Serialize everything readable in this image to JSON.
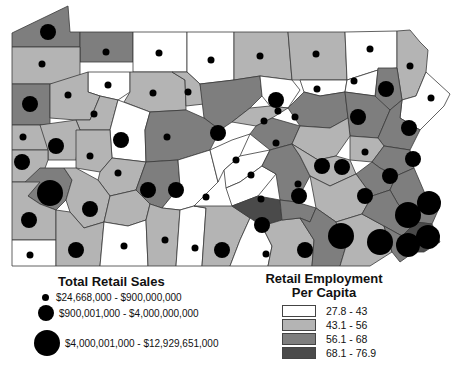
{
  "colors": {
    "class1": "#ffffff",
    "class2": "#b4b4b4",
    "class3": "#7e7e7e",
    "class4": "#4a4a4a",
    "symbol": "#000000",
    "border": "#3a3a3a"
  },
  "legend_sales": {
    "title": "Total Retail Sales",
    "items": [
      {
        "label": "$24,668,000 - $900,000,000",
        "size": "small"
      },
      {
        "label": "$900,001,000 - $4,000,000,000",
        "size": "medium"
      },
      {
        "label": "$4,000,001,000 - $12,929,651,000",
        "size": "large"
      }
    ]
  },
  "legend_employment": {
    "title_line1": "Retail Employment",
    "title_line2": "Per Capita",
    "items": [
      {
        "label": "27.8 - 43",
        "color": "#ffffff"
      },
      {
        "label": "43.1 - 56",
        "color": "#b4b4b4"
      },
      {
        "label": "56.1 - 68",
        "color": "#7e7e7e"
      },
      {
        "label": "68.1 - 76.9",
        "color": "#4a4a4a"
      }
    ]
  },
  "map": {
    "region": "Pennsylvania counties",
    "symbol_classes": {
      "small": 3.5,
      "medium": 8,
      "large": 13
    }
  }
}
